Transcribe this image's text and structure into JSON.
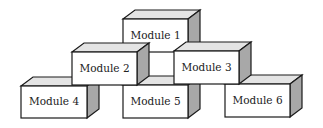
{
  "diagram": {
    "type": "stacked-blocks",
    "modules": [
      {
        "id": "m1",
        "label": "Module 1",
        "x": 123,
        "y": 19,
        "w": 65,
        "h": 33
      },
      {
        "id": "m2",
        "label": "Module 2",
        "x": 72,
        "y": 52,
        "w": 65,
        "h": 33
      },
      {
        "id": "m3",
        "label": "Module 3",
        "x": 174,
        "y": 51,
        "w": 65,
        "h": 33
      },
      {
        "id": "m4",
        "label": "Module 4",
        "x": 21,
        "y": 86,
        "w": 66,
        "h": 32
      },
      {
        "id": "m5",
        "label": "Module 5",
        "x": 123,
        "y": 85,
        "w": 65,
        "h": 33
      },
      {
        "id": "m6",
        "label": "Module 6",
        "x": 225,
        "y": 84,
        "w": 65,
        "h": 33
      }
    ],
    "depth": {
      "dx": 12,
      "dy": 9
    },
    "colors": {
      "front": "#ffffff",
      "top": "#e4e4e4",
      "side": "#a8a8a8",
      "stroke": "#1a1a1a"
    }
  }
}
